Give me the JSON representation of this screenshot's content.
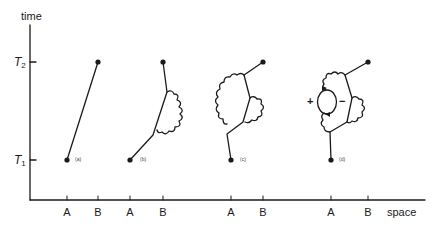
{
  "axes": {
    "y_title": "time",
    "x_title": "space",
    "y_ticks": [
      {
        "label": "T",
        "sub": "2",
        "y": 62
      },
      {
        "label": "T",
        "sub": "1",
        "y": 160
      }
    ],
    "x_ticks": [
      {
        "label": "A",
        "x": 67
      },
      {
        "label": "B",
        "x": 98
      },
      {
        "label": "A",
        "x": 130
      },
      {
        "label": "B",
        "x": 163
      },
      {
        "label": "A",
        "x": 231
      },
      {
        "label": "B",
        "x": 263
      },
      {
        "label": "A",
        "x": 331
      },
      {
        "label": "B",
        "x": 368
      }
    ]
  },
  "panels": [
    {
      "id": "a",
      "label": "(a)"
    },
    {
      "id": "b",
      "label": "(b)"
    },
    {
      "id": "c",
      "label": "(c)"
    },
    {
      "id": "d",
      "label": "(d)",
      "loop_signs": {
        "left": "+",
        "right": "−"
      }
    }
  ],
  "colors": {
    "ink": "#1a1a1a",
    "background": "#ffffff"
  }
}
